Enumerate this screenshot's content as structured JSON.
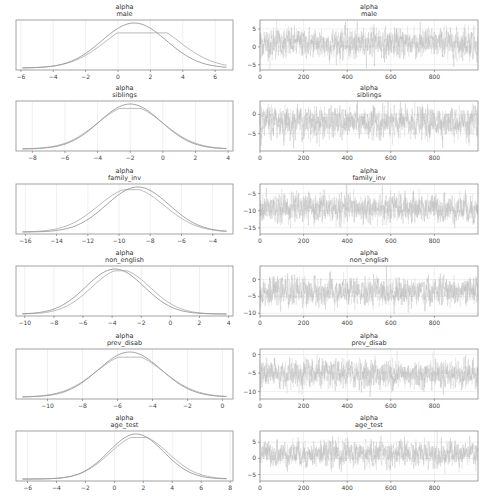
{
  "chart_data": [
    {
      "type": "line",
      "kind": "posterior-density",
      "title": "alpha\nmale",
      "title_lines": [
        "alpha",
        "male"
      ],
      "xticks": [
        -6,
        -4,
        -2,
        0,
        2,
        4,
        6
      ],
      "xlim": [
        -6.3,
        7.1
      ],
      "series": [
        {
          "name": "chain 1",
          "mode": 1.0,
          "sd": 2.0,
          "peak_rel": 1.0
        },
        {
          "name": "chain 2",
          "mode": 1.5,
          "sd": 2.2,
          "peak_rel": 0.78
        }
      ]
    },
    {
      "type": "line",
      "kind": "trace",
      "title": "alpha\nmale",
      "title_lines": [
        "alpha",
        "male"
      ],
      "xticks": [
        0,
        200,
        400,
        600,
        800
      ],
      "xlim": [
        0,
        1000
      ],
      "yticks": [
        -5,
        0,
        5
      ],
      "ylim": [
        -6.5,
        7.5
      ],
      "mean": 1.0,
      "sd": 2.0,
      "n": 1000
    },
    {
      "type": "line",
      "kind": "posterior-density",
      "title_lines": [
        "alpha",
        "siblings"
      ],
      "xticks": [
        -8,
        -6,
        -4,
        -2,
        0,
        2,
        4
      ],
      "xlim": [
        -9.0,
        4.3
      ],
      "series": [
        {
          "name": "chain 1",
          "mode": -2.0,
          "sd": 1.9,
          "peak_rel": 1.0
        },
        {
          "name": "chain 2",
          "mode": -2.0,
          "sd": 2.0,
          "peak_rel": 0.95
        }
      ]
    },
    {
      "type": "line",
      "kind": "trace",
      "title_lines": [
        "alpha",
        "siblings"
      ],
      "xticks": [
        0,
        200,
        400,
        600,
        800
      ],
      "xlim": [
        0,
        1000
      ],
      "yticks": [
        -5,
        0
      ],
      "ylim": [
        -9.5,
        3.5
      ],
      "mean": -2.0,
      "sd": 1.9,
      "n": 1000
    },
    {
      "type": "line",
      "kind": "posterior-density",
      "title_lines": [
        "alpha",
        "family_inv"
      ],
      "xticks": [
        -16,
        -14,
        -12,
        -10,
        -8,
        -6,
        -4
      ],
      "xlim": [
        -16.6,
        -2.7
      ],
      "series": [
        {
          "name": "chain 1",
          "mode": -8.8,
          "sd": 2.0,
          "peak_rel": 1.0
        },
        {
          "name": "chain 2",
          "mode": -9.2,
          "sd": 2.1,
          "peak_rel": 0.97
        }
      ]
    },
    {
      "type": "line",
      "kind": "trace",
      "title_lines": [
        "alpha",
        "family_inv"
      ],
      "xticks": [
        0,
        200,
        400,
        600,
        800
      ],
      "xlim": [
        0,
        1000
      ],
      "yticks": [
        -15,
        -10,
        -5
      ],
      "ylim": [
        -16.8,
        -2.2
      ],
      "mean": -9.3,
      "sd": 2.0,
      "n": 1000
    },
    {
      "type": "line",
      "kind": "posterior-density",
      "title_lines": [
        "alpha",
        "non_english"
      ],
      "xticks": [
        -10,
        -8,
        -6,
        -4,
        -2,
        0,
        2,
        4
      ],
      "xlim": [
        -10.6,
        4.3
      ],
      "series": [
        {
          "name": "chain 1",
          "mode": -3.8,
          "sd": 2.0,
          "peak_rel": 1.0
        },
        {
          "name": "chain 2",
          "mode": -3.4,
          "sd": 2.0,
          "peak_rel": 0.98
        }
      ]
    },
    {
      "type": "line",
      "kind": "trace",
      "title_lines": [
        "alpha",
        "non_english"
      ],
      "xticks": [
        0,
        200,
        400,
        600,
        800
      ],
      "xlim": [
        0,
        1000
      ],
      "yticks": [
        -10,
        -5,
        0
      ],
      "ylim": [
        -10.8,
        4.0
      ],
      "mean": -3.6,
      "sd": 2.0,
      "n": 1000
    },
    {
      "type": "line",
      "kind": "posterior-density",
      "title_lines": [
        "alpha",
        "prev_disab"
      ],
      "xticks": [
        -10,
        -8,
        -6,
        -4,
        -2,
        0
      ],
      "xlim": [
        -11.8,
        0.6
      ],
      "series": [
        {
          "name": "chain 1",
          "mode": -5.3,
          "sd": 1.8,
          "peak_rel": 1.0
        },
        {
          "name": "chain 2",
          "mode": -5.3,
          "sd": 1.9,
          "peak_rel": 0.94
        }
      ]
    },
    {
      "type": "line",
      "kind": "trace",
      "title_lines": [
        "alpha",
        "prev_disab"
      ],
      "xticks": [
        0,
        200,
        400,
        600,
        800
      ],
      "xlim": [
        0,
        1000
      ],
      "yticks": [
        -10,
        -5,
        0
      ],
      "ylim": [
        -12.0,
        1.5
      ],
      "mean": -5.3,
      "sd": 1.8,
      "n": 1000
    },
    {
      "type": "line",
      "kind": "posterior-density",
      "title_lines": [
        "alpha",
        "age_test"
      ],
      "xticks": [
        -6,
        -4,
        -2,
        0,
        2,
        4,
        6,
        8
      ],
      "xlim": [
        -6.8,
        8.2
      ],
      "series": [
        {
          "name": "chain 1",
          "mode": 1.5,
          "sd": 1.9,
          "peak_rel": 1.0
        },
        {
          "name": "chain 2",
          "mode": 1.7,
          "sd": 2.0,
          "peak_rel": 0.96
        }
      ]
    },
    {
      "type": "line",
      "kind": "trace",
      "title_lines": [
        "alpha",
        "age_test"
      ],
      "xticks": [
        0,
        200,
        400,
        600,
        800
      ],
      "xlim": [
        0,
        1000
      ],
      "yticks": [
        -5,
        0,
        5
      ],
      "ylim": [
        -7.0,
        8.5
      ],
      "mean": 1.5,
      "sd": 1.9,
      "n": 1000
    }
  ],
  "colors": {
    "chain1": "#7a7a7a",
    "chain2": "#9a9a9a",
    "trace": "#b0b0b0",
    "grid": "#e6e6e6",
    "frame": "#8c8c8c"
  }
}
